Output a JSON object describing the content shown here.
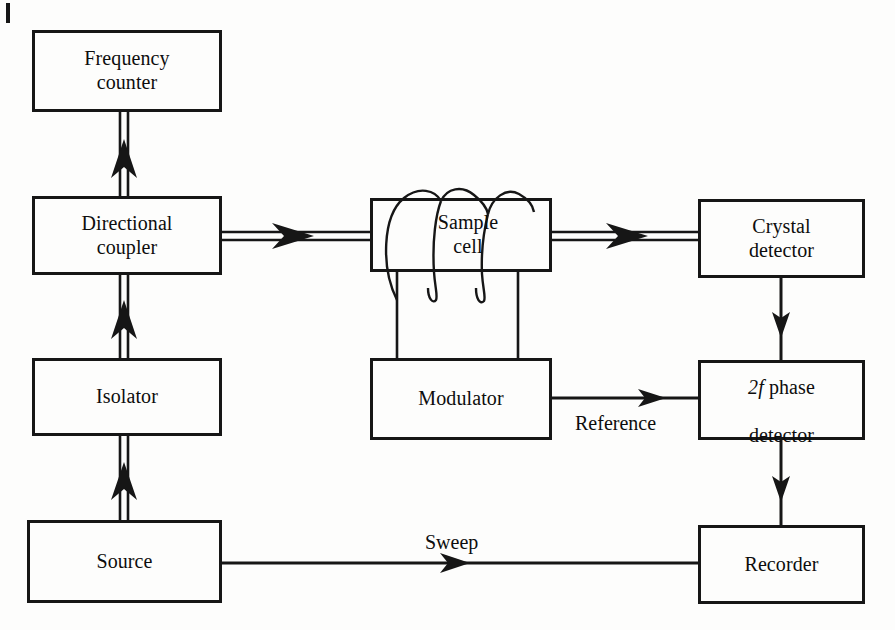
{
  "figure": {
    "kind": "block-diagram",
    "background_color": "#fdfdfc",
    "line_color": "#161616"
  },
  "blocks": [
    {
      "id": "frequency-counter",
      "label": "Frequency\ncounter",
      "x": 32,
      "y": 30,
      "w": 190,
      "h": 82
    },
    {
      "id": "directional-coupler",
      "label": "Directional\ncoupler",
      "x": 32,
      "y": 196,
      "w": 190,
      "h": 79
    },
    {
      "id": "sample-cell",
      "label": "Sample\ncell",
      "x": 370,
      "y": 198,
      "w": 182,
      "h": 74
    },
    {
      "id": "crystal-detector",
      "label": "Crystal\ndetector",
      "x": 698,
      "y": 199,
      "w": 167,
      "h": 79
    },
    {
      "id": "isolator",
      "label": "Isolator",
      "x": 32,
      "y": 358,
      "w": 190,
      "h": 78
    },
    {
      "id": "modulator",
      "label": "Modulator",
      "x": 370,
      "y": 358,
      "w": 182,
      "h": 82
    },
    {
      "id": "phase-detector",
      "label": "2f phase\ndetector",
      "x": 698,
      "y": 360,
      "w": 167,
      "h": 80
    },
    {
      "id": "source",
      "label": "Source",
      "x": 27,
      "y": 520,
      "w": 195,
      "h": 83
    },
    {
      "id": "recorder",
      "label": "Recorder",
      "x": 698,
      "y": 525,
      "w": 167,
      "h": 79
    }
  ],
  "phase_detector_text": {
    "prefix_italic": "2f",
    "rest_line1": " phase",
    "line2": "detector"
  },
  "edge_labels": [
    {
      "id": "reference",
      "text": "Reference",
      "x": 575,
      "y": 412
    },
    {
      "id": "sweep",
      "text": "Sweep",
      "x": 425,
      "y": 531
    }
  ],
  "connections": [
    {
      "id": "source-to-isolator",
      "style": "waveguide",
      "from": "source",
      "to": "isolator",
      "direction": "up"
    },
    {
      "id": "isolator-to-coupler",
      "style": "waveguide",
      "from": "isolator",
      "to": "directional-coupler",
      "direction": "up"
    },
    {
      "id": "coupler-to-frequency-counter",
      "style": "waveguide",
      "from": "directional-coupler",
      "to": "frequency-counter",
      "direction": "up"
    },
    {
      "id": "coupler-to-sample-cell",
      "style": "waveguide",
      "from": "directional-coupler",
      "to": "sample-cell",
      "direction": "right"
    },
    {
      "id": "sample-cell-to-crystal-detector",
      "style": "waveguide",
      "from": "sample-cell",
      "to": "crystal-detector",
      "direction": "right"
    },
    {
      "id": "crystal-to-phase-detector",
      "style": "wire",
      "from": "crystal-detector",
      "to": "phase-detector",
      "direction": "down"
    },
    {
      "id": "modulator-to-phase-detector",
      "style": "wire",
      "from": "modulator",
      "to": "phase-detector",
      "direction": "right",
      "label": "Reference"
    },
    {
      "id": "phase-detector-to-recorder",
      "style": "wire",
      "from": "phase-detector",
      "to": "recorder",
      "direction": "down"
    },
    {
      "id": "source-to-recorder",
      "style": "wire",
      "from": "source",
      "to": "recorder",
      "direction": "right",
      "label": "Sweep"
    },
    {
      "id": "coil-to-modulator-left",
      "style": "wire",
      "from": "sample-cell-coil",
      "to": "modulator",
      "direction": "down"
    },
    {
      "id": "coil-to-modulator-right",
      "style": "wire",
      "from": "sample-cell-coil",
      "to": "modulator",
      "direction": "down"
    }
  ],
  "coil": {
    "id": "sample-cell-coil",
    "turns": 3,
    "wrapped_around": "sample-cell"
  },
  "corner_tick": {
    "x": 6,
    "y": 3,
    "w": 4,
    "h": 20
  }
}
